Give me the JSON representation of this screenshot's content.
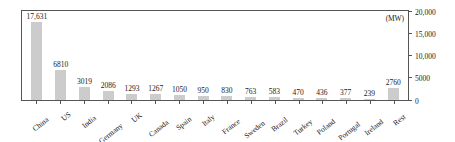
{
  "chart_data": {
    "type": "bar",
    "title": "",
    "subtitle": "",
    "xlabel": "",
    "ylabel": "",
    "unit_label": "(MW)",
    "ylim": [
      0,
      20000
    ],
    "grid": false,
    "legend": null,
    "y_axis_position": "right",
    "bar_color": "#cccccc",
    "axis_color": "#555555",
    "text_color": "#1a1a1a",
    "yticks": [
      {
        "value": 20000,
        "label": "20,000"
      },
      {
        "value": 15000,
        "label": "15,000"
      },
      {
        "value": 10000,
        "label": "10,000"
      },
      {
        "value": 5000,
        "label": "5000"
      },
      {
        "value": 0,
        "label": "0"
      }
    ],
    "categories": [
      "China",
      "US",
      "India",
      "Germany",
      "UK",
      "Canada",
      "Spain",
      "Italy",
      "France",
      "Sweden",
      "Brazil",
      "Turkey",
      "Poland",
      "Portugal",
      "Ireland",
      "Rest"
    ],
    "values": [
      17631,
      6810,
      3019,
      2086,
      1293,
      1267,
      1050,
      950,
      830,
      763,
      583,
      470,
      436,
      377,
      239,
      2760
    ],
    "value_labels": [
      "17,631",
      "6810",
      "3019",
      "2086",
      "1293",
      "1267",
      "1050",
      "950",
      "830",
      "763",
      "583",
      "470",
      "436",
      "377",
      "239",
      "2760"
    ]
  }
}
